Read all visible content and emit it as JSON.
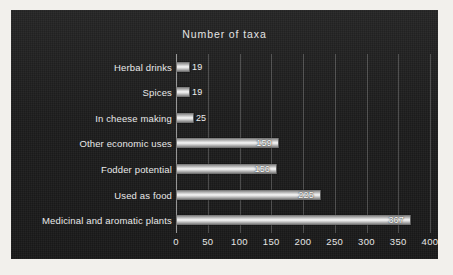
{
  "chart_data": {
    "type": "bar",
    "orientation": "horizontal",
    "title": "Number of taxa",
    "xlabel": "",
    "ylabel": "",
    "categories": [
      "Herbal drinks",
      "Spices",
      "In cheese making",
      "Other economic uses",
      "Fodder potential",
      "Used as food",
      "Medicinal and aromatic plants"
    ],
    "values": [
      19,
      19,
      25,
      159,
      156,
      225,
      367
    ],
    "value_labels": [
      "19",
      "19",
      "25",
      "159",
      "156",
      "225",
      "367"
    ],
    "xlim": [
      0,
      400
    ],
    "xticks": [
      0,
      50,
      100,
      150,
      200,
      250,
      300,
      350,
      400
    ],
    "xtick_labels": [
      "0",
      "50",
      "100",
      "150",
      "200",
      "250",
      "300",
      "350",
      "400"
    ],
    "grid": "vertical",
    "legend": "none",
    "colors": {
      "panel_background": "#1c1c1c",
      "outer_background": "#f2f0ec",
      "text": "#e9e9e9",
      "bar_highlight": "#f4f4f4",
      "bar_shadow": "#636363",
      "gridline": "#bebebe"
    }
  }
}
